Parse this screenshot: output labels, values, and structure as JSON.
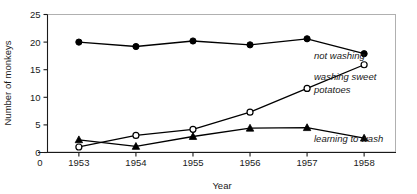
{
  "chart_data": {
    "type": "line",
    "title": "",
    "xlabel": "Year",
    "ylabel": "Number of monkeys",
    "categories": [
      "1953",
      "1954",
      "1955",
      "1956",
      "1957",
      "1958"
    ],
    "x": [
      1953,
      1954,
      1955,
      1956,
      1957,
      1958
    ],
    "xlim": [
      1952.45,
      1958.55
    ],
    "ylim": [
      0,
      25
    ],
    "yticks": [
      0,
      5,
      10,
      15,
      20,
      25
    ],
    "ytick_labels": [
      "0",
      "5",
      "10",
      "15",
      "20",
      "25"
    ],
    "xtick_labels": [
      "0",
      "1953",
      "1954",
      "1955",
      "1956",
      "1957",
      "1958"
    ],
    "x_origin_label": "0",
    "grid": false,
    "legend_position": "right-inline",
    "series": [
      {
        "name": "not washing",
        "marker": "filled-circle",
        "color": "#000000",
        "values": [
          20.0,
          19.2,
          20.2,
          19.5,
          20.6,
          17.9
        ]
      },
      {
        "name": "washing sweet potatoes",
        "marker": "open-circle",
        "color": "#000000",
        "values": [
          1.0,
          3.1,
          4.2,
          7.3,
          11.6,
          15.9
        ]
      },
      {
        "name": "learning to wash",
        "marker": "filled-triangle",
        "color": "#000000",
        "values": [
          2.3,
          1.1,
          2.9,
          4.4,
          4.5,
          2.6
        ]
      }
    ]
  },
  "legend": {
    "entries": [
      {
        "label": "not washing",
        "lines": [
          "not washing"
        ]
      },
      {
        "label": "washing sweet potatoes",
        "lines": [
          "washing sweet",
          "potatoes"
        ]
      },
      {
        "label": "learning to wash",
        "lines": [
          "learning to wash"
        ]
      }
    ]
  },
  "colors": {
    "ink": "#000000",
    "frame": "#b0b0b0",
    "background": "#ffffff"
  }
}
